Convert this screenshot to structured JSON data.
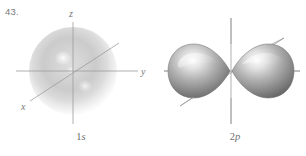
{
  "figure": {
    "number_label": "43.",
    "background_color": "#ffffff",
    "ink_color": "#6f6f6f",
    "axis_color": "#9a9a9a"
  },
  "panels": [
    {
      "id": "1s",
      "caption_principal": "1",
      "caption_subshell": "s",
      "caption_full": "1s",
      "orbital_shape": "sphere",
      "axes": [
        {
          "name": "z-axis",
          "label": "z",
          "direction": "vertical-up"
        },
        {
          "name": "y-axis",
          "label": "y",
          "direction": "horizontal-right"
        },
        {
          "name": "x-axis",
          "label": "x",
          "direction": "diagonal-lower-left"
        }
      ],
      "fill_light": "#f0f0f0",
      "fill_dark": "#b8b8b8"
    },
    {
      "id": "2p",
      "caption_principal": "2",
      "caption_subshell": "p",
      "caption_full": "2p",
      "orbital_shape": "dumbbell-two-lobes",
      "lobe_count": 2,
      "axes": [
        {
          "name": "vertical-axis",
          "label": "",
          "direction": "vertical"
        },
        {
          "name": "horizontal-axis",
          "label": "",
          "direction": "horizontal"
        },
        {
          "name": "diagonal-axis",
          "label": "",
          "direction": "diagonal"
        }
      ],
      "fill_light": "#fbfbfb",
      "fill_mid": "#a6a6a6",
      "fill_dark": "#6d6d6d"
    }
  ]
}
